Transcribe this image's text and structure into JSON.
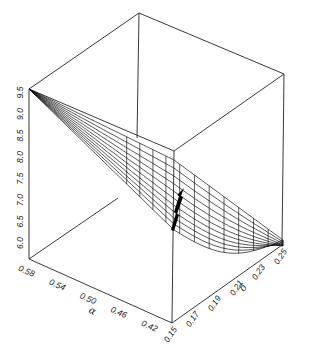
{
  "chart_data": {
    "type": "surface3d",
    "title": "",
    "x_axis": {
      "label": "α",
      "ticks": [
        "0.58",
        "0.54",
        "0.50",
        "0.46",
        "0.42"
      ],
      "range": [
        0.58,
        0.4
      ]
    },
    "y_axis": {
      "label": "δ",
      "ticks": [
        "0.15",
        "0.17",
        "0.19",
        "0.21",
        "0.23",
        "0.25"
      ],
      "range": [
        0.15,
        0.25
      ]
    },
    "z_axis": {
      "label": "",
      "ticks": [
        "6.0",
        "6.5",
        "7.0",
        "7.5",
        "8.0",
        "8.5",
        "9.0",
        "9.5"
      ],
      "range": [
        5.8,
        9.5
      ]
    },
    "surface": {
      "description": "Wireframe mesh surface descending from z≈9.5 at α=0.58 toward z≈6.0 at low α, curving across δ",
      "max_z": 9.5,
      "min_z": 6.0
    },
    "annotations": [
      {
        "type": "arrow",
        "description": "black arrow on surface pointing downward toward minimum near δ=0.15"
      }
    ],
    "grid": false,
    "legend": null,
    "box": true
  }
}
